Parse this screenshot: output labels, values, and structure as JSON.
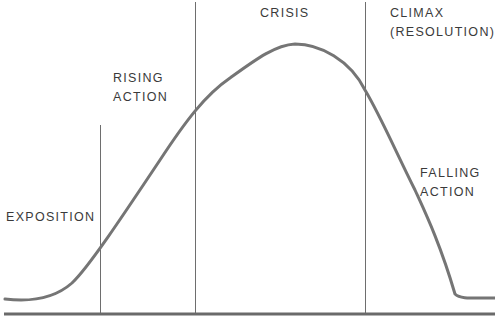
{
  "diagram": {
    "colors": {
      "curve": "#757575",
      "divider": "#6e6e6e",
      "baseline": "#6a6a6a",
      "text": "#3a3a3a",
      "background": "#ffffff"
    },
    "labels": {
      "exposition": [
        "EXPOSITION"
      ],
      "rising_action": [
        "RISING",
        "ACTION"
      ],
      "crisis": [
        "CRISIS"
      ],
      "climax": [
        "CLIMAX",
        "(RESOLUTION)"
      ],
      "falling_action": [
        "FALLING",
        "ACTION"
      ]
    },
    "stages": [
      "Exposition",
      "Rising Action",
      "Crisis",
      "Climax (Resolution)",
      "Falling Action"
    ]
  }
}
